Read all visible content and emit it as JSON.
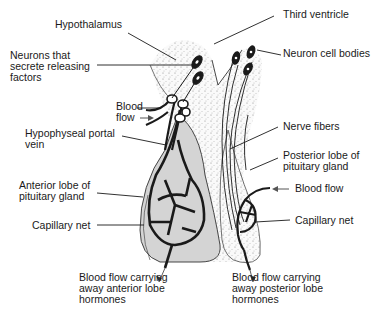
{
  "diagram": {
    "labels": {
      "hypothalamus": "Hypothalamus",
      "neurons_releasing": "Neurons that\nsecrete releasing\nfactors",
      "blood_flow_left": "Blood\nflow",
      "portal_vein": "Hypophyseal portal\nvein",
      "anterior_lobe": "Anterior lobe of\npituitary gland",
      "capillary_net_left": "Capillary net",
      "blood_out_anterior": "Blood flow carrying\naway anterior lobe\nhormones",
      "third_ventricle": "Third ventricle",
      "neuron_cell_bodies": "Neuron cell bodies",
      "nerve_fibers": "Nerve fibers",
      "posterior_lobe": "Posterior lobe of\npituitary gland",
      "blood_flow_right": "Blood flow",
      "capillary_net_right": "Capillary net",
      "blood_out_posterior": "Blood flow carrying\naway posterior lobe\nhormones"
    },
    "colors": {
      "ink": "#1a1a1a",
      "gland_fill": "#d4d4d4",
      "tissue_fill": "#f1f1f1"
    }
  }
}
